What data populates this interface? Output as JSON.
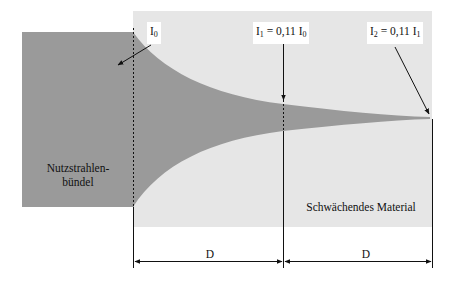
{
  "colors": {
    "background": "#ffffff",
    "beam": "#9a9a9a",
    "material": "#e6e6e6",
    "lines": "#111111"
  },
  "labels": {
    "i0": {
      "symbol": "I",
      "sub": "0"
    },
    "i1": {
      "lhs": "I",
      "lhs_sub": "1",
      "eq": " = 0,11 I",
      "rhs_sub": "0"
    },
    "i2": {
      "lhs": "I",
      "lhs_sub": "2",
      "eq": " = 0,11 I",
      "rhs_sub": "1"
    },
    "beam_line1": "Nutzstrahlen-",
    "beam_line2": "bündel",
    "material": "Schwächendes Material",
    "dim_left": "D",
    "dim_right": "D"
  }
}
